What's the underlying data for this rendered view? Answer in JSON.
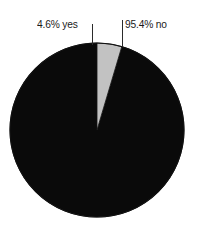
{
  "chart_data": {
    "type": "pie",
    "title": "",
    "subtitle": "",
    "xlabel": "",
    "ylabel": "",
    "legend_position": "none",
    "grid": false,
    "labels_inline": true,
    "start_angle_deg": 0,
    "direction": "counterclockwise",
    "categories": [
      "no",
      "yes"
    ],
    "values": [
      95.4,
      4.6
    ],
    "units": "percent",
    "slices": [
      {
        "name": "no",
        "label": "95.4% no",
        "value": 95.4,
        "percent_text": "95.4%",
        "color": "#0a0a0a"
      },
      {
        "name": "yes",
        "label": "4.6% yes",
        "value": 4.6,
        "percent_text": "4.6%",
        "color": "#c2c2c2"
      }
    ]
  },
  "figure": {
    "background": "#ffffff",
    "outline_color": "#111111",
    "leader_line_color": "#2b2b2b",
    "center_x": 97,
    "center_y": 130,
    "radius": 87
  },
  "labels": {
    "yes": "4.6% yes",
    "no": "95.4% no"
  }
}
